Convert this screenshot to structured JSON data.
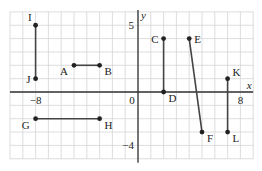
{
  "diagram": {
    "type": "coordinate_grid_segments",
    "grid": {
      "xmin": -10,
      "xmax": 9,
      "ymin": -5,
      "ymax": 6,
      "origin_px": [
        138,
        92
      ],
      "unit_px": [
        12.8,
        13.35
      ],
      "grid_color": "#d4d4d4",
      "axis_color": "#333333",
      "segment_color": "#444444"
    },
    "axes": {
      "x_label": "x",
      "y_label": "y",
      "ticks": [
        {
          "text": "−8",
          "axis": "x",
          "value": -8
        },
        {
          "text": "0",
          "axis": "origin",
          "value": 0
        },
        {
          "text": "8",
          "axis": "x",
          "value": 8
        },
        {
          "text": "5",
          "axis": "y",
          "value": 5
        },
        {
          "text": "−4",
          "axis": "y",
          "value": -4
        }
      ]
    },
    "points": [
      {
        "name": "A",
        "x": -5,
        "y": 2,
        "label_pos": "bl"
      },
      {
        "name": "B",
        "x": -3,
        "y": 2,
        "label_pos": "br"
      },
      {
        "name": "C",
        "x": 2,
        "y": 4,
        "label_pos": "l"
      },
      {
        "name": "D",
        "x": 2,
        "y": 0,
        "label_pos": "br"
      },
      {
        "name": "E",
        "x": 4,
        "y": 4,
        "label_pos": "r"
      },
      {
        "name": "F",
        "x": 5,
        "y": -3,
        "label_pos": "br"
      },
      {
        "name": "G",
        "x": -8,
        "y": -2,
        "label_pos": "bl"
      },
      {
        "name": "H",
        "x": -3,
        "y": -2,
        "label_pos": "br"
      },
      {
        "name": "I",
        "x": -8,
        "y": 5,
        "label_pos": "tl"
      },
      {
        "name": "J",
        "x": -8,
        "y": 1,
        "label_pos": "l"
      },
      {
        "name": "K",
        "x": 7,
        "y": 1,
        "label_pos": "tr"
      },
      {
        "name": "L",
        "x": 7,
        "y": -3,
        "label_pos": "br"
      }
    ],
    "segments": [
      [
        "A",
        "B"
      ],
      [
        "C",
        "D"
      ],
      [
        "E",
        "F"
      ],
      [
        "G",
        "H"
      ],
      [
        "I",
        "J"
      ],
      [
        "K",
        "L"
      ]
    ]
  }
}
